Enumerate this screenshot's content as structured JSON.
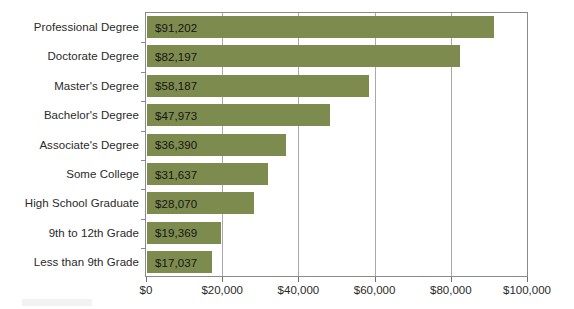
{
  "chart_data": {
    "type": "bar",
    "orientation": "horizontal",
    "title": "",
    "xlabel": "",
    "ylabel": "",
    "xlim": [
      0,
      100000
    ],
    "grid": true,
    "legend": "none",
    "xticks": [
      "$0",
      "$20,000",
      "$40,000",
      "$60,000",
      "$80,000",
      "$100,000"
    ],
    "xtick_values": [
      0,
      20000,
      40000,
      60000,
      80000,
      100000
    ],
    "categories": [
      "Professional Degree",
      "Doctorate Degree",
      "Master's Degree",
      "Bachelor's Degree",
      "Associate's Degree",
      "Some College",
      "High School Graduate",
      "9th to 12th Grade",
      "Less than 9th Grade"
    ],
    "values": [
      91202,
      82197,
      58187,
      47973,
      36390,
      31637,
      28070,
      19369,
      17037
    ],
    "value_labels": [
      "$91,202",
      "$82,197",
      "$58,187",
      "$47,973",
      "$36,390",
      "$31,637",
      "$28,070",
      "$19,369",
      "$17,037"
    ],
    "colors": {
      "bar": "#7d8b4e",
      "gridline": "#a9a9a9",
      "axis": "#8a8a8a",
      "text": "#2a2a2a",
      "background": "#ffffff"
    }
  }
}
